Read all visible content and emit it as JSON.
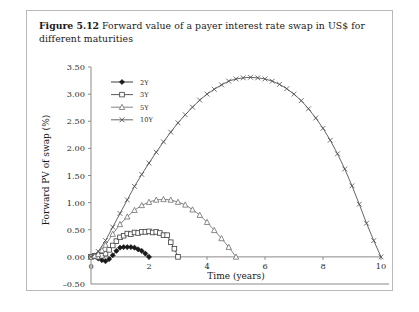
{
  "caption": {
    "figure_number": "Figure 5.12",
    "text": "Forward value of a payer interest rate swap in US$ for different maturities"
  },
  "chart_data": {
    "type": "line",
    "title": "",
    "xlabel": "Time (years)",
    "ylabel": "Forward PV of swap (%)",
    "xlim": [
      0,
      10
    ],
    "ylim": [
      -0.5,
      3.5
    ],
    "xticks": [
      0,
      2,
      4,
      6,
      8,
      10
    ],
    "xtick_labels": [
      "0",
      "2",
      "4",
      "6",
      "8",
      "10"
    ],
    "yticks": [
      -0.5,
      0.0,
      0.5,
      1.0,
      1.5,
      2.0,
      2.5,
      3.0,
      3.5
    ],
    "ytick_labels": [
      "–0.50",
      "0.00",
      "0.50",
      "1.00",
      "1.50",
      "2.00",
      "2.50",
      "3.00",
      "3.50"
    ],
    "grid": false,
    "legend_position": "top-left",
    "series": [
      {
        "name": "2Y",
        "marker": "filled-diamond",
        "color": "#1a1a1a",
        "x": [
          0,
          0.125,
          0.25,
          0.375,
          0.5,
          0.625,
          0.75,
          0.875,
          1.0,
          1.125,
          1.25,
          1.375,
          1.5,
          1.625,
          1.75,
          1.875,
          2.0
        ],
        "y": [
          0.0,
          0.02,
          -0.03,
          -0.06,
          -0.08,
          -0.04,
          0.03,
          0.11,
          0.17,
          0.18,
          0.18,
          0.18,
          0.17,
          0.14,
          0.11,
          0.06,
          0.0
        ]
      },
      {
        "name": "3Y",
        "marker": "open-square",
        "color": "#3c3c3c",
        "x": [
          0,
          0.125,
          0.25,
          0.375,
          0.5,
          0.625,
          0.75,
          0.875,
          1.0,
          1.125,
          1.25,
          1.375,
          1.5,
          1.625,
          1.75,
          1.875,
          2.0,
          2.125,
          2.25,
          2.375,
          2.5,
          2.625,
          2.75,
          2.875,
          3.0
        ],
        "y": [
          0.0,
          0.02,
          0.0,
          0.02,
          0.06,
          0.13,
          0.21,
          0.29,
          0.36,
          0.39,
          0.43,
          0.42,
          0.45,
          0.44,
          0.46,
          0.46,
          0.47,
          0.45,
          0.46,
          0.44,
          0.4,
          0.4,
          0.27,
          0.15,
          0.0
        ]
      },
      {
        "name": "5Y",
        "marker": "open-triangle",
        "color": "#6e6e6e",
        "x": [
          0,
          0.125,
          0.25,
          0.375,
          0.5,
          0.75,
          1.0,
          1.25,
          1.5,
          1.75,
          2.0,
          2.25,
          2.5,
          2.75,
          3.0,
          3.25,
          3.5,
          3.75,
          4.0,
          4.25,
          4.5,
          4.75,
          5.0
        ],
        "y": [
          0.0,
          0.02,
          0.05,
          0.12,
          0.22,
          0.42,
          0.6,
          0.74,
          0.86,
          0.95,
          1.01,
          1.05,
          1.06,
          1.05,
          1.01,
          0.96,
          0.87,
          0.77,
          0.64,
          0.49,
          0.34,
          0.18,
          0.0
        ]
      },
      {
        "name": "10Y",
        "marker": "cross-x",
        "color": "#4a4a4a",
        "x": [
          0,
          0.25,
          0.5,
          0.75,
          1.0,
          1.25,
          1.5,
          1.75,
          2.0,
          2.25,
          2.5,
          2.75,
          3.0,
          3.25,
          3.5,
          3.75,
          4.0,
          4.25,
          4.5,
          4.75,
          5.0,
          5.25,
          5.5,
          5.75,
          6.0,
          6.25,
          6.5,
          6.75,
          7.0,
          7.25,
          7.5,
          7.75,
          8.0,
          8.25,
          8.5,
          8.75,
          9.0,
          9.25,
          9.5,
          9.75,
          10.0
        ],
        "y": [
          0.0,
          0.1,
          0.3,
          0.55,
          0.8,
          1.05,
          1.3,
          1.52,
          1.73,
          1.93,
          2.12,
          2.3,
          2.47,
          2.62,
          2.76,
          2.89,
          3.0,
          3.09,
          3.17,
          3.24,
          3.28,
          3.3,
          3.31,
          3.3,
          3.28,
          3.24,
          3.18,
          3.1,
          3.0,
          2.88,
          2.73,
          2.56,
          2.37,
          2.15,
          1.9,
          1.62,
          1.31,
          0.97,
          0.62,
          0.3,
          0.0
        ]
      }
    ]
  }
}
